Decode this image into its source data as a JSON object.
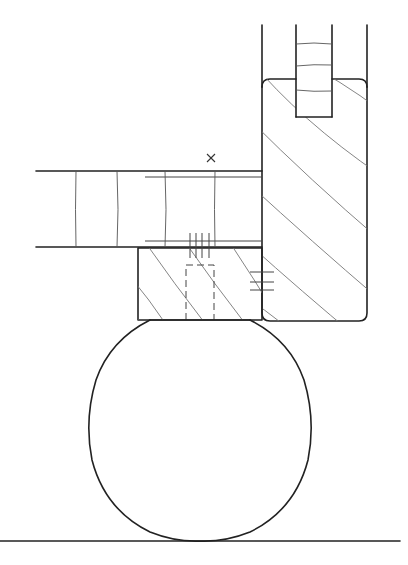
{
  "figure": {
    "type": "technical-drawing",
    "colors": {
      "background": "#ffffff",
      "outline": "#222222",
      "hatch": "#777777"
    }
  },
  "annotations": {
    "reference_mark": "×"
  }
}
